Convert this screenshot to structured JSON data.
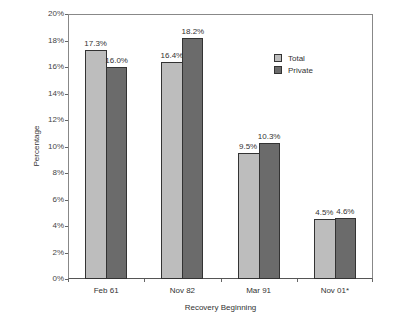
{
  "chart_data": {
    "type": "bar",
    "title": "",
    "xlabel": "Recovery Beginning",
    "ylabel": "Percentage",
    "ylim": [
      0,
      20
    ],
    "yticks": [
      "0%",
      "2%",
      "4%",
      "6%",
      "8%",
      "10%",
      "12%",
      "14%",
      "16%",
      "18%",
      "20%"
    ],
    "grid": false,
    "legend_position": "upper right (inside plot)",
    "categories": [
      "Feb 61",
      "Nov 82",
      "Mar 91",
      "Nov 01*"
    ],
    "series": [
      {
        "name": "Total",
        "color": "#bdbdbd",
        "values": [
          17.3,
          16.4,
          9.5,
          4.5
        ],
        "labels": [
          "17.3%",
          "16.4%",
          "9.5%",
          "4.5%"
        ]
      },
      {
        "name": "Private",
        "color": "#6b6b6b",
        "values": [
          16.0,
          18.2,
          10.3,
          4.6
        ],
        "labels": [
          "16.0%",
          "18.2%",
          "10.3%",
          "4.6%"
        ]
      }
    ]
  }
}
